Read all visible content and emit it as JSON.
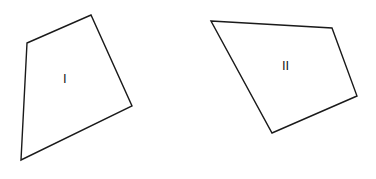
{
  "figure": {
    "width": 376,
    "height": 179,
    "background_color": "#ffffff",
    "stroke_color": "#1a1a1a",
    "stroke_width": 1.4,
    "label_color": "#1a1a1a"
  },
  "shapes": [
    {
      "id": "shape-1",
      "label": "I",
      "label_position": {
        "x": 63,
        "y": 72
      },
      "vertex_count": 4,
      "points": "27,43 91,15 132,106 21,160",
      "vertices": [
        {
          "name": "top-left",
          "x": 27,
          "y": 43
        },
        {
          "name": "top",
          "x": 91,
          "y": 15
        },
        {
          "name": "right",
          "x": 132,
          "y": 106
        },
        {
          "name": "bottom-left",
          "x": 21,
          "y": 160
        }
      ]
    },
    {
      "id": "shape-2",
      "label": "II",
      "label_position": {
        "x": 282,
        "y": 59
      },
      "vertex_count": 4,
      "points": "211,21 332,28 357,96 272,133",
      "vertices": [
        {
          "name": "top-left",
          "x": 211,
          "y": 21
        },
        {
          "name": "top-right",
          "x": 332,
          "y": 28
        },
        {
          "name": "right",
          "x": 357,
          "y": 96
        },
        {
          "name": "bottom",
          "x": 272,
          "y": 133
        }
      ]
    }
  ],
  "chart_data": {
    "type": "diagram",
    "grid": false,
    "legend": "none",
    "items": [
      {
        "label": "I",
        "shape": "quadrilateral",
        "vertices": [
          [
            27,
            43
          ],
          [
            91,
            15
          ],
          [
            132,
            106
          ],
          [
            21,
            160
          ]
        ]
      },
      {
        "label": "II",
        "shape": "quadrilateral",
        "vertices": [
          [
            211,
            21
          ],
          [
            332,
            28
          ],
          [
            357,
            96
          ],
          [
            272,
            133
          ]
        ]
      }
    ]
  }
}
